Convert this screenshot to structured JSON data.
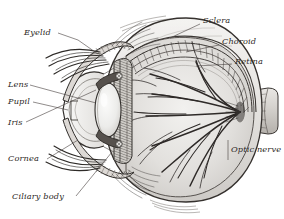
{
  "figure": {
    "style": "engraving",
    "background_color": "#ffffff",
    "ink_color": "#2b2724",
    "width": 284,
    "height": 219
  },
  "labels": {
    "eyelid": {
      "text": "Eyelid",
      "x": 24,
      "y": 34,
      "align": "left"
    },
    "lens": {
      "text": "Lens",
      "x": 8,
      "y": 86,
      "align": "left"
    },
    "pupil": {
      "text": "Pupil",
      "x": 8,
      "y": 103,
      "align": "left"
    },
    "iris": {
      "text": "Iris",
      "x": 8,
      "y": 124,
      "align": "left"
    },
    "cornea": {
      "text": "Cornea",
      "x": 8,
      "y": 160,
      "align": "left"
    },
    "ciliary": {
      "text": "Ciliary body",
      "x": 12,
      "y": 198,
      "align": "left"
    },
    "sclera": {
      "text": "Sclera",
      "x": 203,
      "y": 21,
      "align": "left"
    },
    "choroid": {
      "text": "Choroid",
      "x": 222,
      "y": 42,
      "align": "left"
    },
    "retina": {
      "text": "Retina",
      "x": 235,
      "y": 62,
      "align": "left"
    },
    "optic_nerve": {
      "text": "Optic nerve",
      "x": 231,
      "y": 148,
      "align": "left"
    }
  },
  "parts": [
    "eyelid",
    "eyelashes",
    "lens",
    "pupil",
    "iris",
    "cornea",
    "ciliary body",
    "sclera",
    "choroid",
    "retina",
    "optic nerve",
    "vitreous body",
    "retinal vessels"
  ]
}
